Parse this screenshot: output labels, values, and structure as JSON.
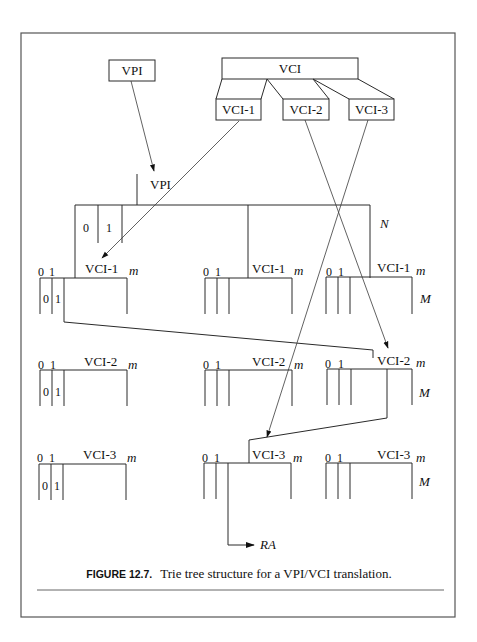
{
  "figure": {
    "caption_label": "FIGURE 12.7.",
    "caption_text": "Trie tree structure for a VPI/VCI translation."
  },
  "header_fields": {
    "vpi_box": "VPI",
    "vci_box": "VCI",
    "vci_subfields": [
      "VCI-1",
      "VCI-2",
      "VCI-3"
    ]
  },
  "root_node": {
    "label": "VPI",
    "index_labels": [
      "0",
      "1"
    ],
    "size_label": "N"
  },
  "levels": [
    {
      "name": "VCI-1",
      "nodes": [
        {
          "label": "VCI-1",
          "index_labels": [
            "0",
            "1"
          ],
          "size_label": "m",
          "inner_labels": [
            "0",
            "1"
          ]
        },
        {
          "label": "VCI-1",
          "index_labels": [
            "0",
            "1"
          ],
          "size_label": "m"
        },
        {
          "label": "VCI-1",
          "index_labels": [
            "0",
            "1"
          ],
          "size_label": "m",
          "count_label": "M"
        }
      ]
    },
    {
      "name": "VCI-2",
      "nodes": [
        {
          "label": "VCI-2",
          "index_labels": [
            "0",
            "1"
          ],
          "size_label": "m",
          "inner_labels": [
            "0",
            "1"
          ]
        },
        {
          "label": "VCI-2",
          "index_labels": [
            "0",
            "1"
          ],
          "size_label": "m"
        },
        {
          "label": "VCI-2",
          "index_labels": [
            "0",
            "1"
          ],
          "size_label": "m",
          "count_label": "M"
        }
      ]
    },
    {
      "name": "VCI-3",
      "nodes": [
        {
          "label": "VCI-3",
          "index_labels": [
            "0",
            "1"
          ],
          "size_label": "m",
          "inner_labels": [
            "0",
            "1"
          ]
        },
        {
          "label": "VCI-3",
          "index_labels": [
            "0",
            "1"
          ],
          "size_label": "m"
        },
        {
          "label": "VCI-3",
          "index_labels": [
            "0",
            "1"
          ],
          "size_label": "m",
          "count_label": "M"
        }
      ]
    }
  ],
  "result": {
    "label": "RA"
  }
}
